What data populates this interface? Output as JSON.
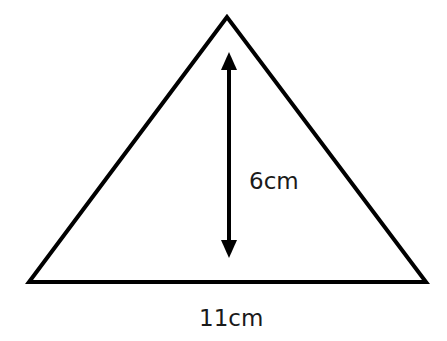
{
  "diagram": {
    "shape": "triangle",
    "stroke_color": "#000000",
    "height_label": "6cm",
    "base_label": "11cm"
  }
}
